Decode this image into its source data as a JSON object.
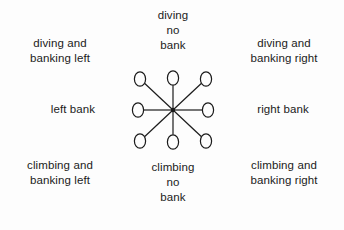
{
  "figure": {
    "background_color": "#fdfdfd",
    "ink_color": "#1b1b1b"
  },
  "labels": {
    "diving_banking_left": {
      "line1": "diving and",
      "line2": "banking left"
    },
    "diving_no_bank": {
      "line1": "diving",
      "line2": "no",
      "line3": "bank"
    },
    "diving_banking_right": {
      "line1": "diving and",
      "line2": "banking right"
    },
    "left_bank": {
      "line1": "left bank"
    },
    "right_bank": {
      "line1": "right bank"
    },
    "climbing_banking_left": {
      "line1": "climbing and",
      "line2": "banking left"
    },
    "climbing_no_bank": {
      "line1": "climbing",
      "line2": "no",
      "line3": "bank"
    },
    "climbing_banking_right": {
      "line1": "climbing and",
      "line2": "banking right"
    }
  },
  "diagram": {
    "center": {
      "x": 173,
      "y": 110
    },
    "node_rx": 5.6,
    "node_ry": 7.2,
    "nodes": [
      {
        "id": "node-diving-banking-left",
        "x": 140,
        "y": 79,
        "state": "diving and banking left"
      },
      {
        "id": "node-diving-no-bank",
        "x": 173,
        "y": 78,
        "state": "diving no bank"
      },
      {
        "id": "node-diving-banking-right",
        "x": 206,
        "y": 79,
        "state": "diving and banking right"
      },
      {
        "id": "node-left-bank",
        "x": 138,
        "y": 110,
        "state": "left bank"
      },
      {
        "id": "node-right-bank",
        "x": 208,
        "y": 110,
        "state": "right bank"
      },
      {
        "id": "node-climbing-banking-left",
        "x": 140,
        "y": 141,
        "state": "climbing and banking left"
      },
      {
        "id": "node-climbing-no-bank",
        "x": 173,
        "y": 142,
        "state": "climbing no bank"
      },
      {
        "id": "node-climbing-banking-right",
        "x": 206,
        "y": 141,
        "state": "climbing and banking right"
      }
    ]
  }
}
